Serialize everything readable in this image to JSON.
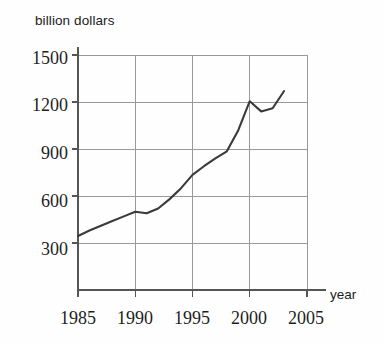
{
  "chart_data": {
    "type": "line",
    "title": "",
    "subtitle": "",
    "xlabel": "year",
    "ylabel": "billion dollars",
    "xlim": [
      1985,
      2005
    ],
    "ylim": [
      0,
      1500
    ],
    "grid": true,
    "legend": null,
    "xticks": [
      "1985",
      "1990",
      "1995",
      "2000",
      "2005"
    ],
    "yticks": [
      "300",
      "600",
      "900",
      "1200",
      "1500"
    ],
    "x": [
      1985,
      1986,
      1987,
      1988,
      1989,
      1990,
      1991,
      1992,
      1993,
      1994,
      1995,
      1996,
      1997,
      1998,
      1999,
      2000,
      2001,
      2002,
      2003
    ],
    "values": [
      345,
      380,
      410,
      440,
      470,
      500,
      490,
      520,
      580,
      650,
      735,
      790,
      840,
      885,
      1020,
      1205,
      1140,
      1160,
      1270
    ],
    "series": [
      {
        "name": "billion dollars",
        "color": "#3a3a3a",
        "values": [
          345,
          380,
          410,
          440,
          470,
          500,
          490,
          520,
          580,
          650,
          735,
          790,
          840,
          885,
          1020,
          1205,
          1140,
          1160,
          1270
        ]
      }
    ]
  },
  "axis": {
    "ylabel": "billion dollars",
    "xlabel": "year",
    "ytick_labels": [
      "1500",
      "1200",
      "900",
      "600",
      "300"
    ],
    "xtick_labels": [
      "1985",
      "1990",
      "1995",
      "2000",
      "2005"
    ]
  },
  "colors": {
    "line": "#3a3a3a",
    "grid": "#9a9a9a",
    "axis": "#555555",
    "text": "#1f1f1f",
    "background": "#fefefe"
  }
}
